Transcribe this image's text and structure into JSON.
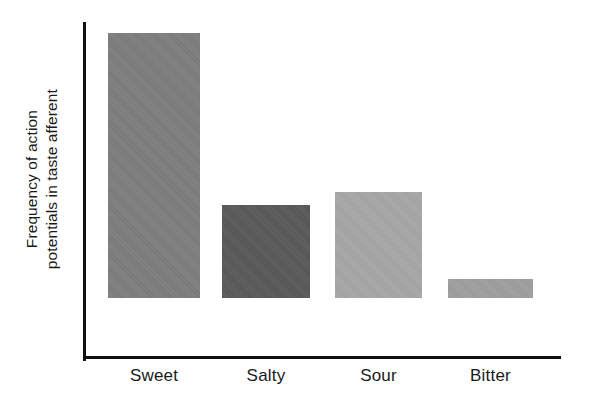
{
  "chart_data": {
    "type": "bar",
    "title": "",
    "subtitle": "",
    "xlabel": "",
    "ylabel_lines": [
      "Frequency of action",
      "potentials in taste afferent"
    ],
    "ylabel": "Frequency of action potentials in taste afferent",
    "categories": [
      "Sweet",
      "Salty",
      "Sour",
      "Bitter"
    ],
    "values": [
      100,
      35,
      40,
      7
    ],
    "value_unit": "relative frequency (Sweet = 100)",
    "ylim": [
      0,
      127
    ],
    "grid": false,
    "legend": null,
    "tick_labels_y": [],
    "annotations": [],
    "bar_colors": [
      "#7d7d7d",
      "#585858",
      "#a6a6a6",
      "#9e9e9e"
    ],
    "axis_color": "#111111",
    "background_color": "#ffffff",
    "bars": [
      {
        "label": "Sweet",
        "value": 100,
        "color": "#7d7d7d"
      },
      {
        "label": "Salty",
        "value": 35,
        "color": "#585858"
      },
      {
        "label": "Sour",
        "value": 40,
        "color": "#a6a6a6"
      },
      {
        "label": "Bitter",
        "value": 7,
        "color": "#9e9e9e"
      }
    ]
  },
  "layout": {
    "bar_left_px": [
      108,
      222,
      335,
      448
    ],
    "bar_width_px": [
      92,
      88,
      87,
      85
    ],
    "baseline_px": 358,
    "plot_top_px": 22,
    "max_bar_height_px": 265
  }
}
